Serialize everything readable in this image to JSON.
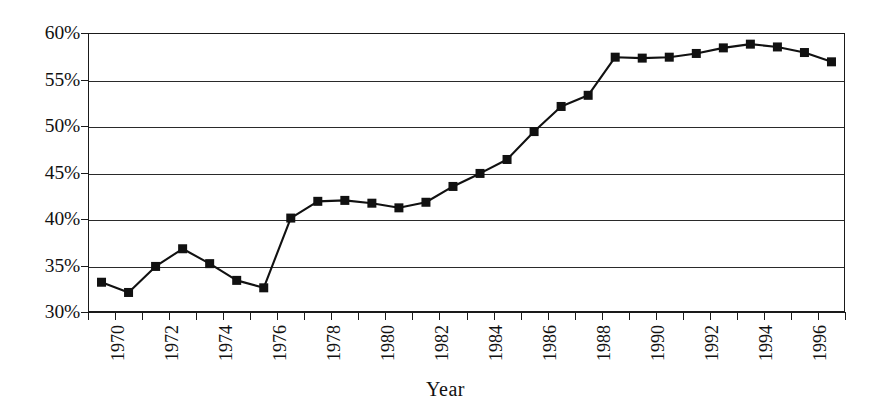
{
  "chart_data": {
    "type": "line",
    "title": "",
    "xlabel": "Year",
    "ylabel": "",
    "ylim": [
      30,
      60
    ],
    "ytick_values": [
      30,
      35,
      40,
      45,
      50,
      55,
      60
    ],
    "ytick_labels": [
      "30%",
      "35%",
      "40%",
      "45%",
      "50%",
      "55%",
      "60%"
    ],
    "grid": "horizontal",
    "legend": "none",
    "marker": "filled-square",
    "line_color": "#111111",
    "marker_color": "#111111",
    "x": [
      1970,
      1971,
      1972,
      1973,
      1974,
      1975,
      1976,
      1977,
      1978,
      1979,
      1980,
      1981,
      1982,
      1983,
      1984,
      1985,
      1986,
      1987,
      1988,
      1989,
      1990,
      1991,
      1992,
      1993,
      1994,
      1995,
      1996,
      1997
    ],
    "xtick_labels": [
      "1970",
      "",
      "1972",
      "",
      "1974",
      "",
      "1976",
      "",
      "1978",
      "",
      "1980",
      "",
      "1982",
      "",
      "1984",
      "",
      "1986",
      "",
      "1988",
      "",
      "1990",
      "",
      "1992",
      "",
      "1994",
      "",
      "1996",
      ""
    ],
    "values": [
      33.2,
      32.1,
      34.9,
      36.8,
      35.2,
      33.4,
      32.6,
      40.1,
      41.9,
      42.0,
      41.7,
      41.2,
      41.8,
      43.5,
      44.9,
      46.4,
      49.4,
      52.1,
      53.3,
      57.4,
      57.3,
      57.4,
      57.8,
      58.4,
      58.8,
      58.5,
      57.9,
      56.9
    ],
    "series": [
      {
        "name": "percent",
        "values": [
          33.2,
          32.1,
          34.9,
          36.8,
          35.2,
          33.4,
          32.6,
          40.1,
          41.9,
          42.0,
          41.7,
          41.2,
          41.8,
          43.5,
          44.9,
          46.4,
          49.4,
          52.1,
          53.3,
          57.4,
          57.3,
          57.4,
          57.8,
          58.4,
          58.8,
          58.5,
          57.9,
          56.9
        ]
      }
    ]
  }
}
